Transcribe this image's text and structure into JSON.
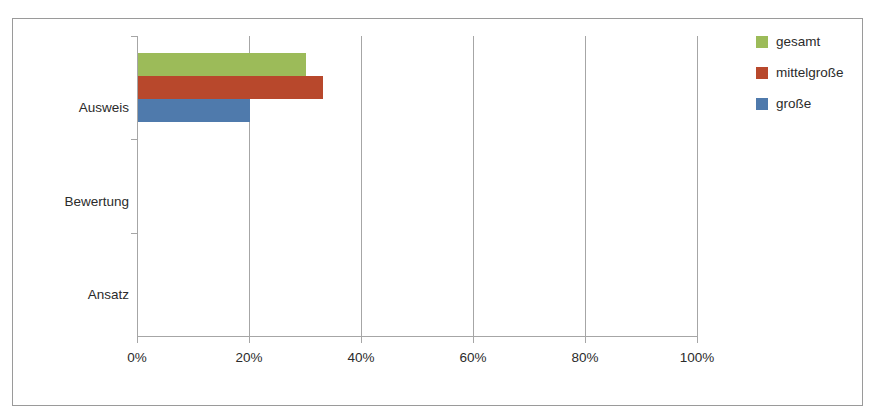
{
  "chart_data": {
    "type": "bar",
    "orientation": "horizontal",
    "title": "",
    "subtitle": "",
    "xlabel": "",
    "ylabel": "",
    "categories": [
      "Ausweis",
      "Bewertung",
      "Ansatz"
    ],
    "category_order_top_to_bottom": [
      "Ausweis",
      "Bewertung",
      "Ansatz"
    ],
    "series": [
      {
        "name": "gesamt",
        "color": "#9CBB59",
        "values": [
          30,
          0,
          0
        ]
      },
      {
        "name": "mittelgroße",
        "color": "#B8482C",
        "values": [
          33,
          0,
          0
        ]
      },
      {
        "name": "große",
        "color": "#4F7AAC",
        "values": [
          20,
          0,
          0
        ]
      }
    ],
    "xlim": [
      0,
      100
    ],
    "xticks": [
      0,
      20,
      40,
      60,
      80,
      100
    ],
    "xtick_labels": [
      "0%",
      "20%",
      "40%",
      "60%",
      "80%",
      "100%"
    ],
    "grid": "vertical",
    "legend_position": "right",
    "value_unit": "%"
  },
  "axis": {
    "x_labels": [
      "0%",
      "20%",
      "40%",
      "60%",
      "80%",
      "100%"
    ],
    "y_labels": [
      "Ausweis",
      "Bewertung",
      "Ansatz"
    ]
  },
  "legend": {
    "items": [
      {
        "label": "gesamt",
        "color": "#9CBB59"
      },
      {
        "label": "mittelgroße",
        "color": "#B8482C"
      },
      {
        "label": "große",
        "color": "#4F7AAC"
      }
    ]
  },
  "colors": {
    "gesamt": "#9CBB59",
    "mittelgrosse": "#B8482C",
    "grosse": "#4F7AAC",
    "axis": "#A6A6A6",
    "border": "#9A9A9A",
    "text": "#2B2B2B",
    "background": "#FFFFFF"
  }
}
